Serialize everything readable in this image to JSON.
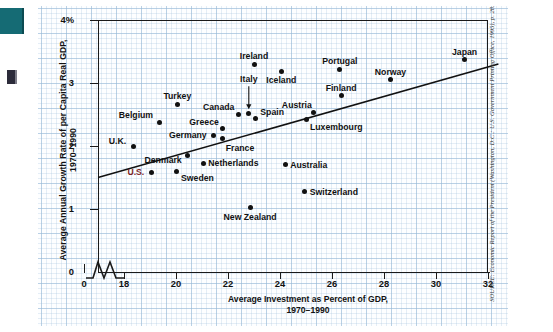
{
  "figure": {
    "source_note": "SOURCE: Economic Report of the President (Washington, D.C.: U.S. Government Printing Office, 1995), p. 28.",
    "source_prefix": "SOURCE:"
  },
  "chart_data": {
    "type": "scatter",
    "title": "",
    "xlabel_line1": "Average Investment as Percent of GDP,",
    "xlabel_line2": "1970–1990",
    "ylabel_line1": "Average Annual Growth Rate of per Capita Real GDP,",
    "ylabel_line2": "1970–1990",
    "xlim": [
      17.0,
      32.0
    ],
    "ylim": [
      0.0,
      4.0
    ],
    "xticks": [
      "0",
      "18",
      "20",
      "22",
      "24",
      "26",
      "28",
      "30",
      "32"
    ],
    "xtick_values": [
      17.0,
      18,
      20,
      22,
      24,
      26,
      28,
      30,
      32
    ],
    "yticks": [
      "0",
      "1",
      "2",
      "3",
      "4%"
    ],
    "ytick_values": [
      0,
      1,
      2,
      3,
      4
    ],
    "axis_break": true,
    "grid": true,
    "grid_style": "graph-paper",
    "legend": "none",
    "trendline": {
      "label": "fitted regression line",
      "x1": 17.0,
      "y1": 1.5,
      "x2": 32.4,
      "y2": 3.3
    },
    "annotations": [
      {
        "name": "italy-leader-arrow",
        "from_label": "Italy",
        "points_to": "Italy data point"
      }
    ],
    "points": [
      {
        "label": "U.K.",
        "x": 18.35,
        "y": 1.99,
        "lx": -7,
        "ly": -10,
        "align": "r",
        "highlight": false
      },
      {
        "label": "Belgium",
        "x": 19.35,
        "y": 2.38,
        "lx": -6,
        "ly": -11,
        "align": "r",
        "highlight": false
      },
      {
        "label": "U.S.",
        "x": 19.05,
        "y": 1.58,
        "lx": -7,
        "ly": -4,
        "align": "r-mid",
        "highlight": true
      },
      {
        "label": "Turkey",
        "x": 20.05,
        "y": 2.66,
        "lx": 0,
        "ly": -12,
        "align": "c",
        "highlight": false
      },
      {
        "label": "Sweden",
        "x": 20.0,
        "y": 1.6,
        "lx": 5,
        "ly": 3,
        "align": "l",
        "highlight": false
      },
      {
        "label": "Denmark",
        "x": 20.45,
        "y": 1.85,
        "lx": -6,
        "ly": 1,
        "align": "r",
        "highlight": false
      },
      {
        "label": "Netherlands",
        "x": 21.05,
        "y": 1.73,
        "lx": 5,
        "ly": -4,
        "align": "l-mid",
        "highlight": false
      },
      {
        "label": "Germany",
        "x": 21.45,
        "y": 2.17,
        "lx": -7,
        "ly": -4,
        "align": "r-mid",
        "highlight": false
      },
      {
        "label": "Greece",
        "x": 21.8,
        "y": 2.27,
        "lx": -4,
        "ly": -11,
        "align": "r",
        "highlight": false
      },
      {
        "label": "France",
        "x": 21.8,
        "y": 2.12,
        "lx": 3,
        "ly": 6,
        "align": "l",
        "highlight": false
      },
      {
        "label": "Canada",
        "x": 22.4,
        "y": 2.5,
        "lx": -4,
        "ly": -12,
        "align": "r",
        "highlight": false
      },
      {
        "label": "Italy",
        "x": 22.8,
        "y": 2.52,
        "lx": 0,
        "ly": -38,
        "align": "c",
        "highlight": false
      },
      {
        "label": "New Zealand",
        "x": 22.85,
        "y": 1.03,
        "lx": 0,
        "ly": 6,
        "align": "c",
        "highlight": false
      },
      {
        "label": "Spain",
        "x": 23.05,
        "y": 2.43,
        "lx": 5,
        "ly": -11,
        "align": "l",
        "highlight": false
      },
      {
        "label": "Ireland",
        "x": 23.0,
        "y": 3.3,
        "lx": 0,
        "ly": -12,
        "align": "c",
        "highlight": false
      },
      {
        "label": "Iceland",
        "x": 24.05,
        "y": 3.18,
        "lx": 0,
        "ly": 4,
        "align": "c",
        "highlight": false
      },
      {
        "label": "Australia",
        "x": 24.2,
        "y": 1.7,
        "lx": 5,
        "ly": -4,
        "align": "l-mid",
        "highlight": false
      },
      {
        "label": "Luxembourg",
        "x": 25.0,
        "y": 2.42,
        "lx": 4,
        "ly": 3,
        "align": "l",
        "highlight": false
      },
      {
        "label": "Switzerland",
        "x": 24.95,
        "y": 1.27,
        "lx": 5,
        "ly": -4,
        "align": "l-mid",
        "highlight": false
      },
      {
        "label": "Austria",
        "x": 25.3,
        "y": 2.53,
        "lx": -2,
        "ly": -12,
        "align": "r",
        "highlight": false
      },
      {
        "label": "Finland",
        "x": 26.35,
        "y": 2.8,
        "lx": 0,
        "ly": -12,
        "align": "c",
        "highlight": false
      },
      {
        "label": "Portugal",
        "x": 26.3,
        "y": 3.22,
        "lx": 0,
        "ly": -12,
        "align": "c",
        "highlight": false
      },
      {
        "label": "Norway",
        "x": 28.25,
        "y": 3.05,
        "lx": 0,
        "ly": -12,
        "align": "c",
        "highlight": false
      },
      {
        "label": "Japan",
        "x": 31.1,
        "y": 3.37,
        "lx": 0,
        "ly": -12,
        "align": "c",
        "highlight": false
      }
    ]
  }
}
